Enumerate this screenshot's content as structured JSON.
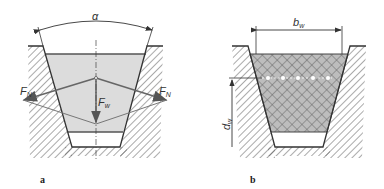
{
  "figure": {
    "panels": [
      {
        "id": "a",
        "caption": "a",
        "angle_label": "α",
        "force_normal_label": "F",
        "force_normal_sub": "N",
        "force_weight_label": "F",
        "force_weight_sub": "w"
      },
      {
        "id": "b",
        "caption": "b",
        "width_label": "b",
        "width_sub": "w",
        "depth_label": "d",
        "depth_sub": "w",
        "cord_count": 5
      }
    ]
  },
  "colors": {
    "line": "#333333",
    "belt_fill": "#dcdcdc",
    "belt_fill_b": "#b9b9b9",
    "force_line": "#666666",
    "hatch": "#555555"
  }
}
